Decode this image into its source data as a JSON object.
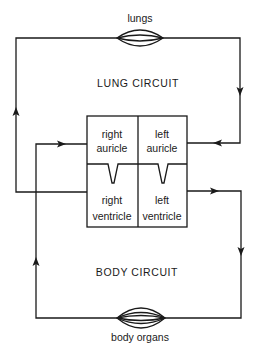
{
  "diagram": {
    "organs": {
      "lungs": "lungs",
      "body_organs": "body organs"
    },
    "circuits": {
      "lung": "LUNG CIRCUIT",
      "body": "BODY CIRCUIT"
    },
    "heart": {
      "right_auricle": [
        "right",
        "auricle"
      ],
      "left_auricle": [
        "left",
        "auricle"
      ],
      "right_ventricle": [
        "right",
        "ventricle"
      ],
      "left_ventricle": [
        "left",
        "ventricle"
      ]
    },
    "flow": [
      {
        "from": "right ventricle",
        "to": "lungs",
        "direction": "up"
      },
      {
        "from": "lungs",
        "to": "left auricle",
        "direction": "down"
      },
      {
        "from": "left ventricle",
        "to": "body organs",
        "direction": "down"
      },
      {
        "from": "body organs",
        "to": "right auricle",
        "direction": "up"
      }
    ],
    "colors": {
      "ink": "#1a1a1a",
      "background": "#ffffff"
    }
  }
}
